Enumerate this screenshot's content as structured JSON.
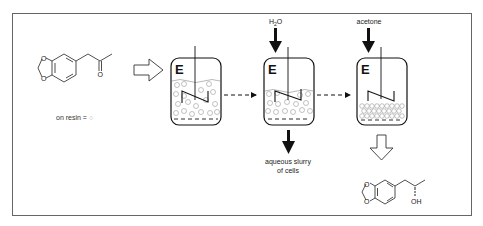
{
  "diagram": {
    "substrate": {
      "name": "3,4-methylenedioxyphenylacetone",
      "label": "on resin = ",
      "resin_symbol": "○",
      "resin_color": "#b0b0b0"
    },
    "vessels": [
      {
        "id": 1,
        "label": "E",
        "state": "resin + cells slurry, dense beads"
      },
      {
        "id": 2,
        "label": "E",
        "input": "H2O",
        "input_display_main": "H",
        "input_display_sub": "2",
        "input_display_tail": "O",
        "output": "aqueous slurry of cells"
      },
      {
        "id": 3,
        "label": "E",
        "input": "acetone",
        "state": "resin beads settled at bottom"
      }
    ],
    "labels": {
      "water_h": "H",
      "water_2": "2",
      "water_o": "O",
      "acetone": "acetone",
      "slurry_line1": "aqueous slurry",
      "slurry_line2": "of cells",
      "oh": "OH"
    },
    "product": {
      "name": "(S)-1-(3,4-methylenedioxyphenyl)-2-propanol"
    },
    "colors": {
      "frame": "#666666",
      "line": "#111111",
      "bead": "#999999"
    }
  }
}
